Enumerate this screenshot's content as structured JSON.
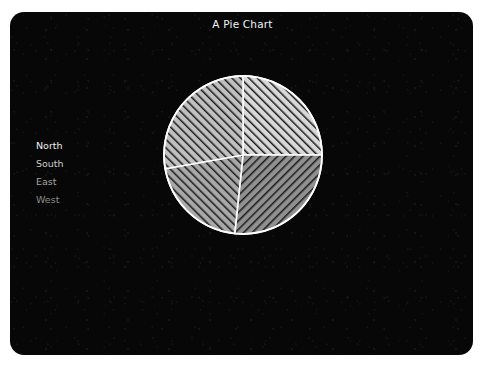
{
  "page": {
    "background_color": "#ffffff",
    "panel_color": "#070707"
  },
  "header": {
    "title": "A Pie Chart",
    "title_color": "#f2f2f2"
  },
  "legend": {
    "position": "left",
    "items": [
      {
        "label": "North",
        "text_color": "#f0f0f0"
      },
      {
        "label": "South",
        "text_color": "#cccccc"
      },
      {
        "label": "East",
        "text_color": "#a6a6a6"
      },
      {
        "label": "West",
        "text_color": "#8c8c8c"
      }
    ]
  },
  "chart_data": {
    "type": "pie",
    "title": "A Pie Chart",
    "xlabel": "",
    "ylabel": "",
    "grid": false,
    "legend_position": "left",
    "start_angle_deg": 0,
    "direction": "clockwise",
    "center": {
      "x": 243,
      "y": 155
    },
    "radius": 79,
    "border_color": "#ffffff",
    "labels": [
      "North",
      "South",
      "East",
      "West"
    ],
    "values": [
      25,
      26.5,
      20.5,
      28
    ],
    "slices": [
      {
        "label": "North",
        "value": 25,
        "percent": 25,
        "start_angle_deg": 0,
        "end_angle_deg": 90,
        "fill_color": "#d8d8d8",
        "hatch_pattern": "forward-slash",
        "hatch_color": "#1a1a1a"
      },
      {
        "label": "South",
        "value": 26.5,
        "percent": 26.5,
        "start_angle_deg": 90,
        "end_angle_deg": 186,
        "fill_color": "#909090",
        "hatch_pattern": "back-slash",
        "hatch_color": "#1a1a1a"
      },
      {
        "label": "East",
        "value": 20.5,
        "percent": 20.5,
        "start_angle_deg": 186,
        "end_angle_deg": 260,
        "fill_color": "#a8a8a8",
        "hatch_pattern": "forward-slash",
        "hatch_color": "#1a1a1a"
      },
      {
        "label": "West",
        "value": 28,
        "percent": 28,
        "start_angle_deg": 260,
        "end_angle_deg": 360,
        "fill_color": "#c0c0c0",
        "hatch_pattern": "forward-slash",
        "hatch_color": "#1a1a1a"
      }
    ]
  }
}
